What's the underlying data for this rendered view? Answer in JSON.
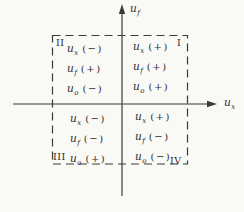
{
  "colors": {
    "line": "#3b3b3b",
    "text": "#2e2e2e",
    "background": "#f9f9f6"
  },
  "axes": {
    "y_label": {
      "base": "u",
      "sub": "f"
    },
    "x_label": {
      "base": "u",
      "sub": "x"
    }
  },
  "quadrants": [
    {
      "numeral": "I",
      "position": "top-right",
      "rows": [
        {
          "base": "u",
          "sub": "x",
          "sign": "(+)"
        },
        {
          "base": "u",
          "sub": "f",
          "sign": "(+)"
        },
        {
          "base": "u",
          "sub": "o",
          "sign": "(+)"
        }
      ]
    },
    {
      "numeral": "II",
      "position": "top-left",
      "rows": [
        {
          "base": "u",
          "sub": "x",
          "sign": "(−)"
        },
        {
          "base": "u",
          "sub": "f",
          "sign": "(+)"
        },
        {
          "base": "u",
          "sub": "o",
          "sign": "(−)"
        }
      ]
    },
    {
      "numeral": "III",
      "position": "bottom-left",
      "rows": [
        {
          "base": "u",
          "sub": "x",
          "sign": "(−)"
        },
        {
          "base": "u",
          "sub": "f",
          "sign": "(−)"
        },
        {
          "base": "u",
          "sub": "o",
          "sign": "(+)"
        }
      ]
    },
    {
      "numeral": "IV",
      "position": "bottom-right",
      "rows": [
        {
          "base": "u",
          "sub": "x",
          "sign": "(+)"
        },
        {
          "base": "u",
          "sub": "f",
          "sign": "(−)"
        },
        {
          "base": "u",
          "sub": "o",
          "sign": "(−)"
        }
      ]
    }
  ]
}
